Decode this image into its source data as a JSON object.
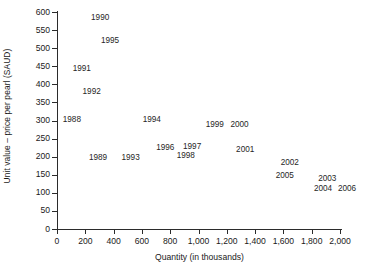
{
  "chart_data": {
    "type": "scatter",
    "title": "",
    "xlabel": "Quantity (in thousands)",
    "ylabel": "Unit value – price per pearl (SAUD)",
    "xlim": [
      0,
      2000
    ],
    "ylim": [
      0,
      600
    ],
    "grid": false,
    "legend": "none",
    "marker": "text-label-only",
    "xticks": [
      0,
      200,
      400,
      600,
      800,
      1000,
      1200,
      1400,
      1600,
      1800,
      2000
    ],
    "xtick_labels": [
      "0",
      "200",
      "400",
      "600",
      "800",
      "1,000",
      "1,200",
      "1,400",
      "1,600",
      "1,800",
      "2,000"
    ],
    "yticks": [
      0,
      50,
      100,
      150,
      200,
      250,
      300,
      350,
      400,
      450,
      500,
      550,
      600
    ],
    "ytick_labels": [
      "0",
      "50",
      "100",
      "150",
      "200",
      "250",
      "300",
      "350",
      "400",
      "450",
      "500",
      "550",
      "600"
    ],
    "points": [
      {
        "label": "1988",
        "x": 105,
        "y": 305
      },
      {
        "label": "1989",
        "x": 290,
        "y": 200
      },
      {
        "label": "1990",
        "x": 305,
        "y": 585
      },
      {
        "label": "1991",
        "x": 175,
        "y": 445
      },
      {
        "label": "1992",
        "x": 245,
        "y": 382
      },
      {
        "label": "1993",
        "x": 520,
        "y": 200
      },
      {
        "label": "1994",
        "x": 670,
        "y": 305
      },
      {
        "label": "1995",
        "x": 375,
        "y": 523
      },
      {
        "label": "1996",
        "x": 765,
        "y": 227
      },
      {
        "label": "1997",
        "x": 955,
        "y": 230
      },
      {
        "label": "1998",
        "x": 910,
        "y": 205
      },
      {
        "label": "1999",
        "x": 1115,
        "y": 290
      },
      {
        "label": "2000",
        "x": 1290,
        "y": 290
      },
      {
        "label": "2001",
        "x": 1330,
        "y": 221
      },
      {
        "label": "2002",
        "x": 1645,
        "y": 185
      },
      {
        "label": "2003",
        "x": 1910,
        "y": 141
      },
      {
        "label": "2004",
        "x": 1880,
        "y": 113
      },
      {
        "label": "2005",
        "x": 1610,
        "y": 149
      },
      {
        "label": "2006",
        "x": 2050,
        "y": 113
      }
    ]
  }
}
